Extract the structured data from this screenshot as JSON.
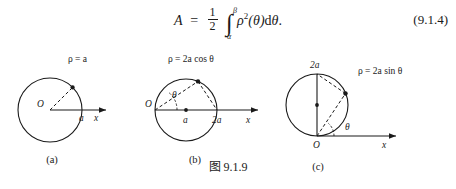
{
  "formula": {
    "lhs": "A",
    "equals": "=",
    "fraction_numerator": "1",
    "fraction_denominator": "2",
    "integral_sign": "∫",
    "lower_limit": "α",
    "upper_limit": "β",
    "integrand_rho": "ρ",
    "integrand_exponent": "2",
    "integrand_arg": "(θ)",
    "differential": "dθ",
    "period": ".",
    "equation_number": "(9.1.4)"
  },
  "figure_caption": "图 9.1.9",
  "diagrams": [
    {
      "id": "a",
      "subcaption": "(a)",
      "equation_label": "ρ = a",
      "origin_label": "O",
      "radius_label": "a",
      "axis_label": "x"
    },
    {
      "id": "b",
      "subcaption": "(b)",
      "equation_label": "ρ = 2a cos θ",
      "origin_label": "O",
      "center_label": "a",
      "diameter_label": "2a",
      "angle_label": "θ",
      "axis_label": "x"
    },
    {
      "id": "c",
      "subcaption": "(c)",
      "equation_label": "ρ = 2a sin θ",
      "origin_label": "O",
      "diameter_label": "2a",
      "angle_label": "θ",
      "axis_label": "x"
    }
  ]
}
